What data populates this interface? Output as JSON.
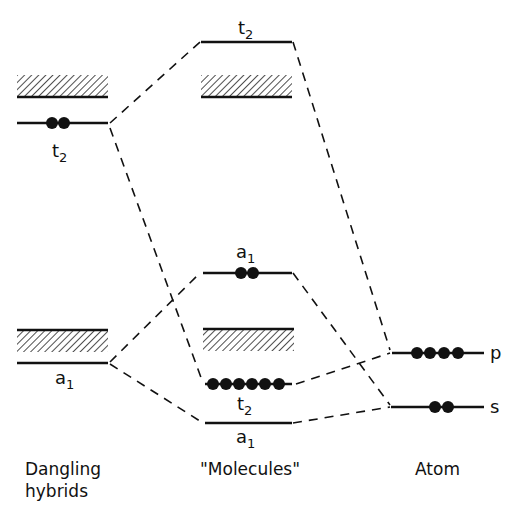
{
  "columns": {
    "dangling": "Dangling",
    "dangling_line2": "hybrids",
    "molecules": "\"Molecules\"",
    "atom": "Atom"
  },
  "levels": {
    "dangling_t2": {
      "symbol": "t",
      "sub": "2",
      "electrons": 2
    },
    "dangling_a1": {
      "symbol": "a",
      "sub": "1",
      "electrons": 0
    },
    "mol_t2_antibonding": {
      "symbol": "t",
      "sub": "2",
      "electrons": 0
    },
    "mol_a1_upper": {
      "symbol": "a",
      "sub": "1",
      "electrons": 2
    },
    "mol_t2_bonding": {
      "symbol": "t",
      "sub": "2",
      "electrons": 6
    },
    "mol_a1_lower": {
      "symbol": "a",
      "sub": "1",
      "electrons": 0
    },
    "atom_p": {
      "symbol": "p",
      "electrons": 4
    },
    "atom_s": {
      "symbol": "s",
      "electrons": 2
    }
  },
  "colors": {
    "ink": "#111111",
    "background": "#ffffff"
  }
}
